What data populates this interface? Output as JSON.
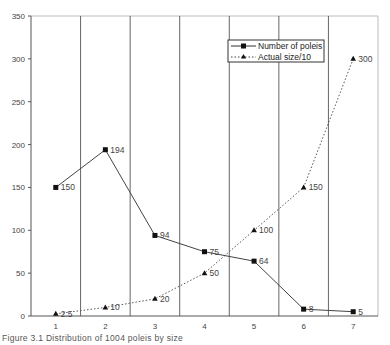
{
  "chart_data": {
    "type": "line",
    "title": "",
    "xlabel": "",
    "ylabel": "",
    "categories": [
      "1",
      "2",
      "3",
      "4",
      "5",
      "6",
      "7"
    ],
    "ylim": [
      0,
      350
    ],
    "yticks": [
      0,
      50,
      100,
      150,
      200,
      250,
      300,
      350
    ],
    "grid": "vertical separators between categories",
    "legend_position": "upper right inside plot",
    "series": [
      {
        "name": "Number of poleis",
        "style": "solid line, square markers",
        "values": [
          150,
          194,
          94,
          75,
          64,
          8,
          5
        ],
        "labels": [
          "150",
          "194",
          "94",
          "75",
          "64",
          "8",
          "5"
        ]
      },
      {
        "name": "Actual size/10",
        "style": "dotted line, triangle markers",
        "values": [
          2.5,
          10,
          20,
          50,
          100,
          150,
          300
        ],
        "labels": [
          "2.5",
          "10",
          "20",
          "50",
          "100",
          "150",
          "300"
        ]
      }
    ]
  },
  "legend": {
    "items": [
      "Number of poleis",
      "Actual size/10"
    ]
  },
  "caption": "Figure 3.1  Distribution of 1004 poleis by size"
}
